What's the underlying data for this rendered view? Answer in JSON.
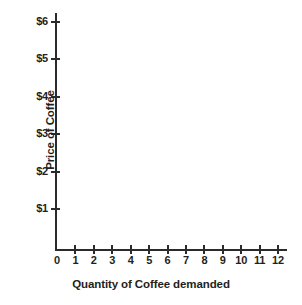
{
  "chart_data": {
    "type": "line",
    "title": "",
    "xlabel": "Quantity of Coffee demanded",
    "ylabel": "Price of Coffee",
    "xlim": [
      0,
      12
    ],
    "ylim": [
      0,
      6
    ],
    "grid": false,
    "legend": null,
    "x_ticks": [
      "0",
      "1",
      "2",
      "3",
      "4",
      "5",
      "6",
      "7",
      "8",
      "9",
      "10",
      "11",
      "12"
    ],
    "y_ticks": [
      "$1",
      "$2",
      "$3",
      "$4",
      "$5",
      "$6"
    ],
    "y_tick_values": [
      1,
      2,
      3,
      4,
      5,
      6
    ],
    "x_tick_values": [
      0,
      1,
      2,
      3,
      4,
      5,
      6,
      7,
      8,
      9,
      10,
      11,
      12
    ],
    "series": [],
    "values": [],
    "annotations": [],
    "note": "Empty axes template with no plotted data"
  },
  "axes": {
    "x_title": "Quantity of Coffee demanded",
    "y_title": "Price of Coffee",
    "x_tick_labels": [
      "0",
      "1",
      "2",
      "3",
      "4",
      "5",
      "6",
      "7",
      "8",
      "9",
      "10",
      "11",
      "12"
    ],
    "y_tick_labels": [
      "$1",
      "$2",
      "$3",
      "$4",
      "$5",
      "$6"
    ]
  },
  "colors": {
    "axis": "#2b2b2b",
    "text": "#231f20",
    "background": "#ffffff"
  }
}
